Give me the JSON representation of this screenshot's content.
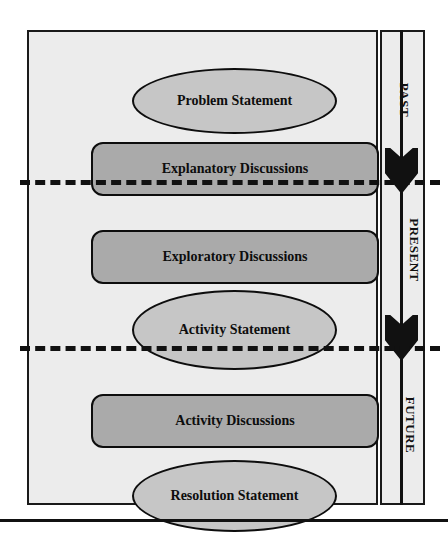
{
  "diagram": {
    "colors": {
      "panel_background": "#ececec",
      "ellipse_fill": "#c6c6c6",
      "rounded_rect_fill": "#aaaaaa",
      "outline": "#0d0d0d",
      "arrow": "#111111"
    },
    "phases": [
      {
        "label": "PAST"
      },
      {
        "label": "PRESENT"
      },
      {
        "label": "FUTURE"
      }
    ],
    "nodes": [
      {
        "label": "Problem Statement",
        "shape": "ellipse",
        "phase": "PAST"
      },
      {
        "label": "Explanatory Discussions",
        "shape": "rounded-rectangle",
        "phase": "PAST"
      },
      {
        "label": "Exploratory Discussions",
        "shape": "rounded-rectangle",
        "phase": "PRESENT"
      },
      {
        "label": "Activity Statement",
        "shape": "ellipse",
        "phase": "PRESENT"
      },
      {
        "label": "Activity Discussions",
        "shape": "rounded-rectangle",
        "phase": "FUTURE"
      },
      {
        "label": "Resolution Statement",
        "shape": "ellipse",
        "phase": "FUTURE"
      }
    ],
    "arrows": [
      {
        "name": "past-to-present-arrow",
        "direction": "down"
      },
      {
        "name": "present-to-future-arrow",
        "direction": "down"
      }
    ],
    "dividers": [
      {
        "name": "past-present-divider",
        "style": "dashed"
      },
      {
        "name": "present-future-divider",
        "style": "dashed"
      }
    ],
    "caption": ""
  }
}
